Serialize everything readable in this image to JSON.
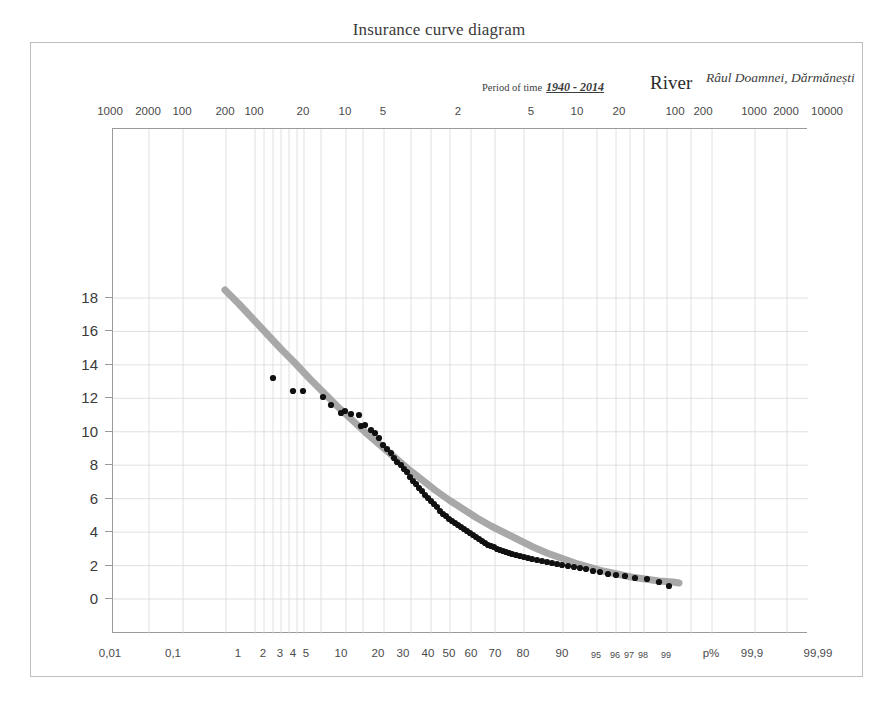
{
  "title": "Insurance curve diagram",
  "header": {
    "period_label": "Period of time",
    "period_value": "1940 - 2014",
    "river_label": "River",
    "river_value": "Râul Doamnei, Dărmănești"
  },
  "annotations": {
    "cs": "Cs = 1,883",
    "cv": "Cv = 0,76"
  },
  "axes": {
    "y_title_main": "Water flow",
    "y_title_unit_pre": "m",
    "y_title_unit_sup": "3",
    "y_title_unit_post": "/s",
    "x_unit_label": "p%"
  },
  "chart_data": {
    "type": "line",
    "title": "Insurance curve diagram",
    "xlabel": "p%",
    "ylabel": "Water flow m3/s",
    "ylim": [
      0,
      19
    ],
    "grid": true,
    "legend": null,
    "x_axis_scale": "normal-probability",
    "y_ticks": [
      0,
      2,
      4,
      6,
      8,
      10,
      12,
      14,
      16,
      18
    ],
    "x_bottom_ticks": [
      {
        "label": "0,01",
        "x": 110
      },
      {
        "label": "0,1",
        "x": 173
      },
      {
        "label": "1",
        "x": 238
      },
      {
        "label": "2",
        "x": 263
      },
      {
        "label": "3",
        "x": 280
      },
      {
        "label": "4",
        "x": 293
      },
      {
        "label": "5",
        "x": 306
      },
      {
        "label": "10",
        "x": 341
      },
      {
        "label": "20",
        "x": 378
      },
      {
        "label": "30",
        "x": 403
      },
      {
        "label": "40",
        "x": 428
      },
      {
        "label": "50",
        "x": 449
      },
      {
        "label": "60",
        "x": 471
      },
      {
        "label": "70",
        "x": 495
      },
      {
        "label": "80",
        "x": 523
      },
      {
        "label": "90",
        "x": 562
      },
      {
        "label": "95",
        "x": 596,
        "small": true
      },
      {
        "label": "96",
        "x": 615,
        "small": true
      },
      {
        "label": "97",
        "x": 629,
        "small": true
      },
      {
        "label": "98",
        "x": 643,
        "small": true
      },
      {
        "label": "99",
        "x": 666,
        "small": true
      },
      {
        "label": "p%",
        "x": 711
      },
      {
        "label": "99,9",
        "x": 752
      },
      {
        "label": "99,99",
        "x": 818
      }
    ],
    "x_top_ticks": [
      {
        "label": "1000",
        "x": 110
      },
      {
        "label": "2000",
        "x": 148
      },
      {
        "label": "100",
        "x": 182
      },
      {
        "label": "200",
        "x": 225
      },
      {
        "label": "100",
        "x": 254
      },
      {
        "label": "20",
        "x": 303
      },
      {
        "label": "10",
        "x": 345
      },
      {
        "label": "5",
        "x": 383
      },
      {
        "label": "2",
        "x": 458
      },
      {
        "label": "5",
        "x": 531
      },
      {
        "label": "10",
        "x": 577
      },
      {
        "label": "20",
        "x": 619
      },
      {
        "label": "100",
        "x": 675
      },
      {
        "label": "200",
        "x": 703
      },
      {
        "label": "1000",
        "x": 754
      },
      {
        "label": "2000",
        "x": 786
      },
      {
        "label": "10000",
        "x": 827
      }
    ],
    "fit_curve": {
      "name": "Pearson III theoretical curve",
      "color": "#a8a8a8",
      "width": 7,
      "points_px": [
        [
          224,
          289
        ],
        [
          238,
          303
        ],
        [
          252,
          318
        ],
        [
          266,
          333
        ],
        [
          280,
          348
        ],
        [
          294,
          362
        ],
        [
          308,
          377
        ],
        [
          322,
          391
        ],
        [
          336,
          405
        ],
        [
          350,
          418
        ],
        [
          364,
          431
        ],
        [
          378,
          443
        ],
        [
          392,
          455
        ],
        [
          406,
          467
        ],
        [
          420,
          478
        ],
        [
          434,
          489
        ],
        [
          448,
          499
        ],
        [
          462,
          508
        ],
        [
          476,
          517
        ],
        [
          490,
          525
        ],
        [
          504,
          532
        ],
        [
          518,
          539
        ],
        [
          532,
          546
        ],
        [
          546,
          552
        ],
        [
          560,
          557
        ],
        [
          574,
          562
        ],
        [
          588,
          566
        ],
        [
          602,
          570
        ],
        [
          616,
          573
        ],
        [
          630,
          576
        ],
        [
          644,
          578
        ],
        [
          658,
          580
        ],
        [
          672,
          581
        ],
        [
          678,
          582
        ]
      ]
    },
    "series": [
      {
        "name": "Observed annual flows",
        "marker": "filled-circle",
        "color": "#111111",
        "points_px": [
          [
            272,
            377
          ],
          [
            292,
            390
          ],
          [
            302,
            390
          ],
          [
            322,
            396
          ],
          [
            330,
            404
          ],
          [
            340,
            412
          ],
          [
            344,
            410
          ],
          [
            350,
            413
          ],
          [
            358,
            414
          ],
          [
            360,
            425
          ],
          [
            364,
            424
          ],
          [
            370,
            429
          ],
          [
            374,
            432
          ],
          [
            378,
            437
          ],
          [
            382,
            444
          ],
          [
            386,
            448
          ],
          [
            390,
            452
          ],
          [
            393,
            457
          ],
          [
            396,
            461
          ],
          [
            400,
            464
          ],
          [
            403,
            468
          ],
          [
            406,
            471
          ],
          [
            409,
            476
          ],
          [
            412,
            480
          ],
          [
            415,
            483
          ],
          [
            418,
            487
          ],
          [
            421,
            490
          ],
          [
            424,
            494
          ],
          [
            427,
            497
          ],
          [
            430,
            500
          ],
          [
            433,
            503
          ],
          [
            436,
            506
          ],
          [
            439,
            510
          ],
          [
            442,
            513
          ],
          [
            445,
            515
          ],
          [
            448,
            518
          ],
          [
            451,
            520
          ],
          [
            454,
            522
          ],
          [
            457,
            524
          ],
          [
            460,
            526
          ],
          [
            463,
            528
          ],
          [
            466,
            530
          ],
          [
            469,
            532
          ],
          [
            472,
            534
          ],
          [
            475,
            536
          ],
          [
            478,
            538
          ],
          [
            481,
            540
          ],
          [
            484,
            542
          ],
          [
            487,
            544
          ],
          [
            490,
            545
          ],
          [
            493,
            546
          ],
          [
            496,
            548
          ],
          [
            499,
            549
          ],
          [
            502,
            550
          ],
          [
            505,
            551
          ],
          [
            508,
            552
          ],
          [
            511,
            553
          ],
          [
            515,
            554
          ],
          [
            519,
            555
          ],
          [
            523,
            556
          ],
          [
            527,
            557
          ],
          [
            531,
            558
          ],
          [
            536,
            559
          ],
          [
            541,
            560
          ],
          [
            546,
            561
          ],
          [
            551,
            562
          ],
          [
            556,
            563
          ],
          [
            561,
            564
          ],
          [
            567,
            565
          ],
          [
            573,
            566
          ],
          [
            579,
            567
          ],
          [
            585,
            568
          ],
          [
            592,
            570
          ],
          [
            599,
            571
          ],
          [
            607,
            573
          ],
          [
            615,
            574
          ],
          [
            624,
            575
          ],
          [
            634,
            577
          ],
          [
            646,
            578
          ],
          [
            658,
            581
          ],
          [
            668,
            585
          ]
        ]
      }
    ],
    "vertical_gridlines_px": [
      110,
      148,
      182,
      225,
      254,
      263,
      272,
      280,
      288,
      296,
      303,
      320,
      345,
      362,
      383,
      410,
      430,
      449,
      470,
      494,
      523,
      562,
      596,
      615,
      629,
      643,
      666,
      690,
      711,
      754,
      786
    ],
    "horizontal_gridlines_y_values": [
      0,
      2,
      4,
      6,
      8,
      10,
      12,
      14,
      16,
      18
    ]
  }
}
